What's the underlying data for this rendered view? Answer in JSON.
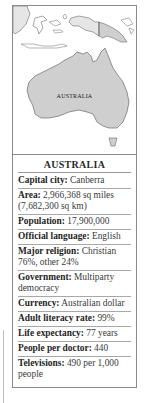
{
  "map": {
    "label": "AUSTRALIA",
    "colors": {
      "land": "#cfcfcf",
      "neighbor": "#e6e6e6",
      "outline": "#6a6a6a"
    }
  },
  "factbox": {
    "title": "AUSTRALIA",
    "rows": [
      {
        "label": "Capital city:",
        "value": "Canberra"
      },
      {
        "label": "Area:",
        "value": "2,966,368 sq miles (7,682,300 sq km)"
      },
      {
        "label": "Population:",
        "value": "17,900,000"
      },
      {
        "label": "Official language:",
        "value": "English"
      },
      {
        "label": "Major religion:",
        "value": "Christian 76%, other 24%"
      },
      {
        "label": "Government:",
        "value": "Multiparty democracy"
      },
      {
        "label": "Currency:",
        "value": "Australian dollar"
      },
      {
        "label": "Adult literacy rate:",
        "value": "99%"
      },
      {
        "label": "Life expectancy:",
        "value": "77 years"
      },
      {
        "label": "People per doctor:",
        "value": "440"
      },
      {
        "label": "Televisions:",
        "value": "490 per 1,000 people"
      }
    ]
  }
}
